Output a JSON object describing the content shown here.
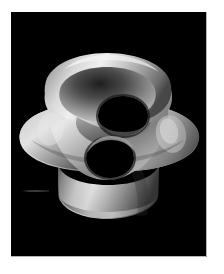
{
  "page": {
    "background_color": "#ffffff",
    "width": 224,
    "height": 274,
    "alt_text": ""
  },
  "render_panel": {
    "background_color": "#000000",
    "left": 11,
    "top": 12,
    "width": 195,
    "height": 244,
    "caption": ""
  },
  "object": {
    "name": "genus-two-surface",
    "description": "",
    "material": "matte metallic grayscale",
    "highlight_color": "#f2f2f2",
    "midtone_color": "#9a9a9a",
    "shadow_color": "#2a2a2a",
    "hole_color": "#000000",
    "hole_count": 2
  },
  "artifact": {
    "name": "scanline",
    "color": "#434343"
  }
}
